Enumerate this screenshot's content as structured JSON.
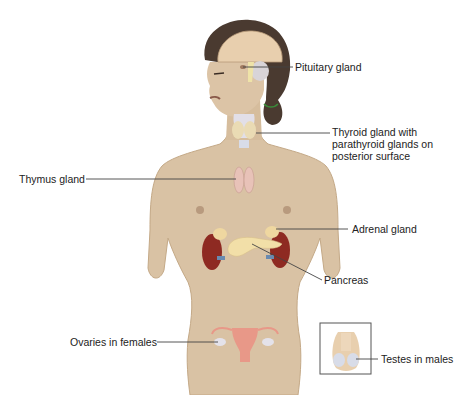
{
  "diagram": {
    "type": "anatomical-illustration",
    "colors": {
      "skin": "#d9c2a4",
      "skin_shadow": "#c4a987",
      "hair": "#4a3a30",
      "brain": "#e8cfae",
      "kidney": "#8e2a22",
      "pancreas": "#f2dfa8",
      "thyroid": "#e9e0c8",
      "thymus": "#e8c2b8",
      "uterus": "#e89888",
      "leader_line": "#444444",
      "text": "#222222",
      "inset_border": "#555555"
    },
    "labels": [
      {
        "id": "pituitary",
        "text": "Pituitary gland"
      },
      {
        "id": "thyroid",
        "text": "Thyroid gland with\nparathyroid glands on\nposterior surface"
      },
      {
        "id": "thymus",
        "text": "Thymus gland"
      },
      {
        "id": "adrenal",
        "text": "Adrenal gland"
      },
      {
        "id": "pancreas",
        "text": "Pancreas"
      },
      {
        "id": "ovaries",
        "text": "Ovaries in females"
      },
      {
        "id": "testes",
        "text": "Testes in males"
      }
    ],
    "inset": {
      "label": "Male reproductive inset",
      "target": "testes"
    }
  }
}
